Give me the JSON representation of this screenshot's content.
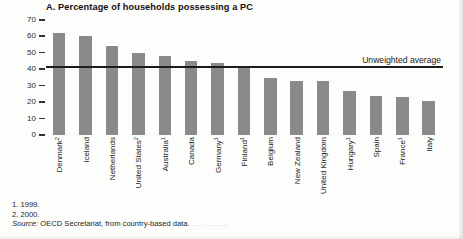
{
  "chart_data": {
    "type": "bar",
    "title": "A. Percentage of households possessing a PC",
    "xlabel": "",
    "ylabel": "",
    "ylim": [
      0,
      70
    ],
    "yticks": [
      70,
      60,
      50,
      40,
      30,
      20,
      10,
      0
    ],
    "grid": false,
    "legend": "none",
    "categories": [
      "Denmark",
      "Iceland",
      "Netherlands",
      "United States",
      "Australia",
      "Canada",
      "Germany",
      "Finland",
      "Belgium",
      "New Zealand",
      "United Kingdom",
      "Hungary",
      "Spain",
      "France",
      "Italy"
    ],
    "category_footnote_markers": [
      "2",
      "",
      "",
      "2",
      "1",
      "",
      "1",
      "1",
      "",
      "",
      "",
      "1",
      "",
      "1",
      ""
    ],
    "values": [
      62,
      60,
      54,
      50,
      48,
      45,
      44,
      42,
      35,
      33,
      33,
      27,
      24,
      23,
      21
    ],
    "annotations": [
      {
        "name": "unweighted-average",
        "label": "Unweighted average",
        "value": 41,
        "type": "horizontal-line"
      }
    ],
    "bar_color": "#8a8a8a",
    "line_color": "#1c1c1c"
  },
  "footnotes": {
    "note1": "1. 1999.",
    "note2": "2. 2000.",
    "source_label": "Source:",
    "source_text": "OECD Secretariat, from country-based data.",
    "trailing_dots": "............"
  }
}
